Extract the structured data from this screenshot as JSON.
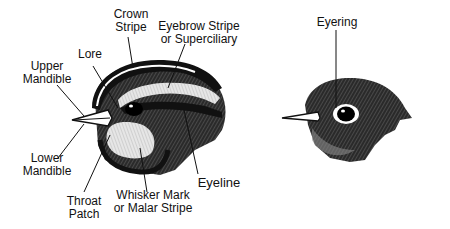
{
  "diagram": {
    "left_bird": {
      "labels": {
        "crown_stripe": [
          "Crown",
          "Stripe"
        ],
        "eyebrow_stripe": [
          "Eyebrow Stripe",
          "or Superciliary"
        ],
        "lore": [
          "Lore"
        ],
        "upper_mandible": [
          "Upper",
          "Mandible"
        ],
        "lower_mandible": [
          "Lower",
          "Mandible"
        ],
        "throat_patch": [
          "Throat",
          "Patch"
        ],
        "whisker_mark": [
          "Whisker Mark",
          "or Malar Stripe"
        ],
        "eyeline": [
          "Eyeline"
        ]
      }
    },
    "right_bird": {
      "labels": {
        "eyering": [
          "Eyering"
        ]
      }
    },
    "colors": {
      "ink": "#111111",
      "background": "#ffffff",
      "light": "#e8e8e8"
    }
  }
}
